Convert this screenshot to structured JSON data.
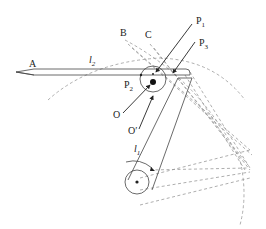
{
  "diagram": {
    "title": "",
    "labels": {
      "A": "A",
      "B": "B",
      "C": "C",
      "P1": "P",
      "P1_sub": "1",
      "P2": "P",
      "P2_sub": "2",
      "P3": "P",
      "P3_sub": "3",
      "O": "O",
      "O_prime": "O′",
      "l1": "l",
      "l1_sub": "1",
      "l2": "l",
      "l2_sub": "2"
    },
    "colors": {
      "solid_line": "#444444",
      "dashed_line": "#999999",
      "text": "#222222",
      "background": "#ffffff"
    }
  }
}
